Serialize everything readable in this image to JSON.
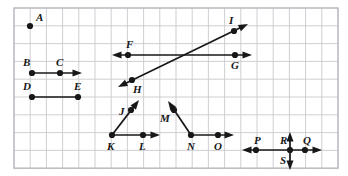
{
  "figure": {
    "grid": {
      "origin_x": 14,
      "origin_y": 8,
      "cell_w": 16.2,
      "cell_h": 17.8,
      "cols": 20,
      "rows": 9,
      "line_color": "#c9c9cf",
      "border_color": "#b5b5bc",
      "background": "#ffffff"
    },
    "style": {
      "ink_color": "#171717",
      "stroke_width": 1.7,
      "dot_radius": 3.1
    },
    "points": [
      {
        "id": "A",
        "label": "A",
        "x": 30,
        "y": 26,
        "label_dx": 6,
        "label_dy": -14
      },
      {
        "id": "B",
        "label": "B",
        "x": 32,
        "y": 73,
        "label_dx": -9,
        "label_dy": -16
      },
      {
        "id": "C",
        "label": "C",
        "x": 60,
        "y": 73,
        "label_dx": -4,
        "label_dy": -16
      },
      {
        "id": "D",
        "label": "D",
        "x": 32,
        "y": 97,
        "label_dx": -9,
        "label_dy": -16
      },
      {
        "id": "E",
        "label": "E",
        "x": 78,
        "y": 97,
        "label_dx": -4,
        "label_dy": -16
      },
      {
        "id": "F",
        "label": "F",
        "x": 128,
        "y": 55,
        "label_dx": -2,
        "label_dy": -16
      },
      {
        "id": "G",
        "label": "G",
        "x": 235,
        "y": 55,
        "label_dx": -4,
        "label_dy": 5
      },
      {
        "id": "H",
        "label": "H",
        "x": 132,
        "y": 80,
        "label_dx": 1,
        "label_dy": 4
      },
      {
        "id": "I",
        "label": "I",
        "x": 234,
        "y": 31,
        "label_dx": -5,
        "label_dy": -16
      },
      {
        "id": "J",
        "label": "J",
        "x": 131,
        "y": 110,
        "label_dx": -12,
        "label_dy": -4
      },
      {
        "id": "K",
        "label": "K",
        "x": 112,
        "y": 135,
        "label_dx": -5,
        "label_dy": 6
      },
      {
        "id": "L",
        "label": "L",
        "x": 143,
        "y": 135,
        "label_dx": -4,
        "label_dy": 6
      },
      {
        "id": "M",
        "label": "M",
        "x": 174,
        "y": 110,
        "label_dx": -14,
        "label_dy": 3
      },
      {
        "id": "N",
        "label": "N",
        "x": 191,
        "y": 135,
        "label_dx": -4,
        "label_dy": 6
      },
      {
        "id": "O",
        "label": "O",
        "x": 218,
        "y": 135,
        "label_dx": -4,
        "label_dy": 6
      },
      {
        "id": "P",
        "label": "P",
        "x": 256,
        "y": 150,
        "label_dx": -2,
        "label_dy": -15
      },
      {
        "id": "Q",
        "label": "Q",
        "x": 305,
        "y": 150,
        "label_dx": -2,
        "label_dy": -15
      },
      {
        "id": "R",
        "label": "R",
        "x": 290,
        "y": 150,
        "label_dx": -10,
        "label_dy": -15
      },
      {
        "id": "S",
        "label": "S",
        "x": 290,
        "y": 150,
        "label_dx": -10,
        "label_dy": 5
      }
    ],
    "figures": [
      {
        "id": "point-A",
        "name": "point-a",
        "kind": "point",
        "through": [
          "A"
        ],
        "x1": 30,
        "y1": 26,
        "x2": 30,
        "y2": 26,
        "arrow_start": false,
        "arrow_end": false
      },
      {
        "id": "ray-BC",
        "name": "ray-bc",
        "kind": "ray",
        "through": [
          "B",
          "C"
        ],
        "x1": 32,
        "y1": 73,
        "x2": 82,
        "y2": 73,
        "arrow_start": false,
        "arrow_end": true
      },
      {
        "id": "segment-DE",
        "name": "segment-de",
        "kind": "segment",
        "through": [
          "D",
          "E"
        ],
        "x1": 32,
        "y1": 97,
        "x2": 78,
        "y2": 97,
        "arrow_start": false,
        "arrow_end": false
      },
      {
        "id": "line-FG",
        "name": "line-fg",
        "kind": "line",
        "through": [
          "F",
          "G"
        ],
        "x1": 112,
        "y1": 55,
        "x2": 252,
        "y2": 55,
        "arrow_start": true,
        "arrow_end": true
      },
      {
        "id": "line-HI",
        "name": "line-hi",
        "kind": "line",
        "through": [
          "H",
          "I"
        ],
        "x1": 118,
        "y1": 87,
        "x2": 248,
        "y2": 24,
        "arrow_start": true,
        "arrow_end": true
      },
      {
        "id": "ray-KJ",
        "name": "ray-kj",
        "kind": "ray",
        "through": [
          "K",
          "J"
        ],
        "x1": 112,
        "y1": 135,
        "x2": 139,
        "y2": 100,
        "arrow_start": false,
        "arrow_end": true
      },
      {
        "id": "ray-KL",
        "name": "ray-kl",
        "kind": "ray",
        "through": [
          "K",
          "L"
        ],
        "x1": 112,
        "y1": 135,
        "x2": 160,
        "y2": 135,
        "arrow_start": false,
        "arrow_end": true
      },
      {
        "id": "ray-NM",
        "name": "ray-nm",
        "kind": "ray",
        "through": [
          "N",
          "M"
        ],
        "x1": 191,
        "y1": 135,
        "x2": 168,
        "y2": 101,
        "arrow_start": false,
        "arrow_end": true
      },
      {
        "id": "ray-NO",
        "name": "ray-no",
        "kind": "ray",
        "through": [
          "N",
          "O"
        ],
        "x1": 191,
        "y1": 135,
        "x2": 234,
        "y2": 135,
        "arrow_start": false,
        "arrow_end": true
      },
      {
        "id": "line-PQ",
        "name": "line-pq",
        "kind": "line",
        "through": [
          "P",
          "Q"
        ],
        "x1": 242,
        "y1": 150,
        "x2": 322,
        "y2": 150,
        "arrow_start": true,
        "arrow_end": true
      },
      {
        "id": "line-RS",
        "name": "line-rs",
        "kind": "line",
        "through": [
          "R",
          "S"
        ],
        "x1": 290,
        "y1": 132,
        "x2": 290,
        "y2": 170,
        "arrow_start": true,
        "arrow_end": true
      }
    ]
  }
}
